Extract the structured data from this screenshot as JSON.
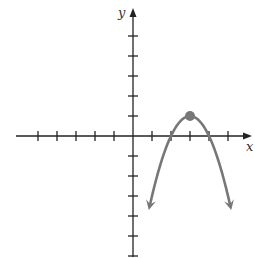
{
  "chart_data": {
    "type": "line",
    "title": "",
    "xlabel": "x",
    "ylabel": "y",
    "grid": false,
    "x_ticks": [
      -5,
      -4,
      -3,
      -2,
      -1,
      1,
      2,
      3,
      4,
      5
    ],
    "y_ticks": [
      -6,
      -5,
      -4,
      -3,
      -2,
      -1,
      1,
      2,
      3,
      4,
      5
    ],
    "xlim": [
      -6,
      5.5
    ],
    "ylim": [
      -6.1,
      6.8
    ],
    "series": [
      {
        "name": "parabola",
        "equation": "y = -(x - 3)^2 + 1",
        "vertex": [
          3,
          1
        ],
        "x_intercepts": [
          2,
          4
        ],
        "arrow_ends": [
          [
            0.9,
            -3.4
          ],
          [
            5.1,
            -3.4
          ]
        ],
        "color": "#777777"
      }
    ],
    "highlighted_point": {
      "x": 3,
      "y": 1,
      "label": "vertex"
    }
  },
  "colors": {
    "axis": "#222222",
    "curve": "#777777",
    "point": "#777777"
  }
}
